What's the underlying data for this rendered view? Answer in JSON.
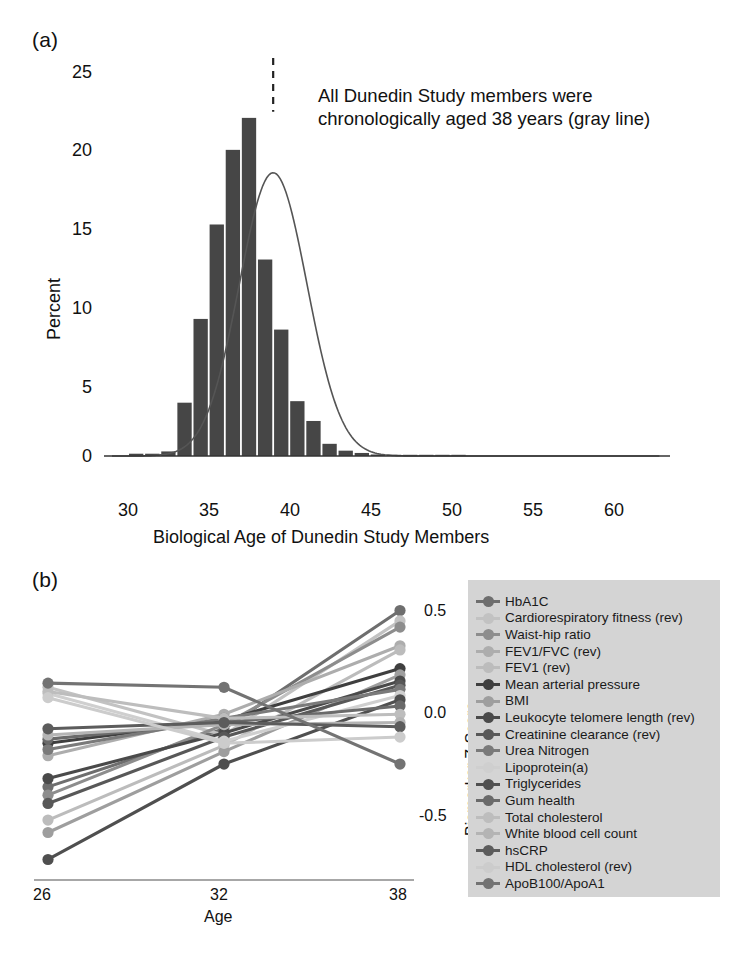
{
  "figure": {
    "panel_a_tag": "(a)",
    "panel_b_tag": "(b)"
  },
  "panel_a": {
    "annotation_line1": "All Dunedin Study members were",
    "annotation_line2": "chronologically aged 38 years (gray line)",
    "reference_line_age": 38,
    "bar_color": "#464646",
    "curve_color": "#555555",
    "reference_line_color": "#222222"
  },
  "panel_b": {
    "axis_color": "#8a8a8a",
    "legend_background": "#d4d4d4",
    "legend_title": "",
    "legend": [
      {
        "label": "HbA1C",
        "color": "#6e6e6e"
      },
      {
        "label": "Cardiorespiratory fitness (rev)",
        "color": "#c2c2c2"
      },
      {
        "label": "Waist-hip ratio",
        "color": "#8d8d8d"
      },
      {
        "label": "FEV1/FVC (rev)",
        "color": "#adadad"
      },
      {
        "label": "FEV1 (rev)",
        "color": "#bcbcbc"
      },
      {
        "label": "Mean arterial pressure",
        "color": "#3f3f3f"
      },
      {
        "label": "BMI",
        "color": "#9e9e9e"
      },
      {
        "label": "Leukocyte telomere length (rev)",
        "color": "#4a4a4a"
      },
      {
        "label": "Creatinine clearance (rev)",
        "color": "#585858"
      },
      {
        "label": "Urea Nitrogen",
        "color": "#7a7a7a"
      },
      {
        "label": " Lipoprotein(a)",
        "color": "#cfcfcf"
      },
      {
        "label": "Triglycerides",
        "color": "#4f4f4f"
      },
      {
        "label": "Gum health",
        "color": "#6a6a6a"
      },
      {
        "label": "Total cholesterol",
        "color": "#bdbdbd"
      },
      {
        "label": "White blood cell count",
        "color": "#b4b4b4"
      },
      {
        "label": "hsCRP",
        "color": "#5c5c5c"
      },
      {
        "label": "HDL cholesterol (rev)",
        "color": "#cccccc"
      },
      {
        "label": "ApoB100/ApoA1",
        "color": "#737373"
      }
    ]
  },
  "chart_data": [
    {
      "type": "bar",
      "title": "",
      "xlabel": "Biological Age of Dunedin Study Members",
      "ylabel": "Percent",
      "xlim": [
        28,
        62
      ],
      "ylim": [
        0,
        26
      ],
      "xticks": [
        30,
        35,
        40,
        45,
        50,
        55,
        60
      ],
      "yticks": [
        0,
        5,
        10,
        15,
        20,
        25
      ],
      "grid": false,
      "bin_width": 1,
      "bin_starts": [
        29,
        30,
        31,
        32,
        33,
        34,
        35,
        36,
        37,
        38,
        39,
        40,
        41,
        42,
        43,
        44,
        45,
        46,
        47,
        48,
        49
      ],
      "values": [
        0.15,
        0.15,
        0.3,
        3.5,
        9.0,
        15.2,
        20.1,
        22.2,
        12.9,
        8.3,
        3.6,
        2.3,
        0.8,
        0.35,
        0.2,
        0.1,
        0.08,
        0.05,
        0.03,
        0.02,
        0.01
      ],
      "overlay_curve": {
        "name": "normal density fit",
        "mean": 38.0,
        "sd": 2.1,
        "peak_percent": 18.6
      },
      "annotations": [
        {
          "text": "All Dunedin Study members were chronologically aged 38 years (gray line)",
          "x": 38,
          "style": "dashed-vertical-reference"
        }
      ]
    },
    {
      "type": "line",
      "title": "",
      "xlabel": "Age",
      "ylabel": "Biomarker Z-Score",
      "x": [
        26,
        32,
        38
      ],
      "xticks": [
        26,
        32,
        38
      ],
      "yticks": [
        -0.5,
        0.0,
        0.5
      ],
      "ylim": [
        -0.72,
        0.62
      ],
      "grid": false,
      "legend_position": "right",
      "series": [
        {
          "name": "HbA1C",
          "values": [
            -0.3,
            -0.02,
            0.55
          ]
        },
        {
          "name": "Cardiorespiratory fitness (rev)",
          "values": [
            0.18,
            -0.05,
            0.5
          ]
        },
        {
          "name": "Waist-hip ratio",
          "values": [
            -0.34,
            0.0,
            0.47
          ]
        },
        {
          "name": "FEV1/FVC (rev)",
          "values": [
            -0.15,
            0.05,
            0.38
          ]
        },
        {
          "name": "FEV1 (rev)",
          "values": [
            -0.46,
            -0.1,
            0.36
          ]
        },
        {
          "name": "Mean arterial pressure",
          "values": [
            -0.09,
            0.02,
            0.27
          ]
        },
        {
          "name": "BMI",
          "values": [
            -0.52,
            -0.13,
            0.24
          ]
        },
        {
          "name": "Leukocyte telomere length (rev)",
          "values": [
            -0.26,
            -0.04,
            0.21
          ]
        },
        {
          "name": "Creatinine clearance (rev)",
          "values": [
            -0.38,
            -0.06,
            0.19
          ]
        },
        {
          "name": "Urea Nitrogen",
          "values": [
            -0.12,
            0.03,
            0.17
          ]
        },
        {
          "name": " Lipoprotein(a)",
          "values": [
            0.15,
            -0.08,
            0.14
          ]
        },
        {
          "name": "Triglycerides",
          "values": [
            -0.65,
            -0.19,
            0.12
          ]
        },
        {
          "name": "Gum health",
          "values": [
            -0.07,
            0.01,
            0.09
          ]
        },
        {
          "name": "Total cholesterol",
          "values": [
            0.16,
            0.03,
            0.05
          ]
        },
        {
          "name": "White blood cell count",
          "values": [
            -0.05,
            0.0,
            0.01
          ]
        },
        {
          "name": "hsCRP",
          "values": [
            -0.02,
            0.01,
            -0.01
          ]
        },
        {
          "name": "HDL cholesterol (rev)",
          "values": [
            0.13,
            -0.09,
            -0.06
          ]
        },
        {
          "name": "ApoB100/ApoA1",
          "values": [
            0.2,
            0.18,
            -0.19
          ]
        }
      ]
    }
  ]
}
